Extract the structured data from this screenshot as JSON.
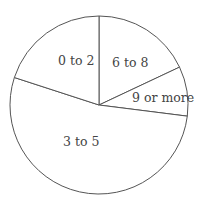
{
  "chart_data": {
    "type": "pie",
    "title": "",
    "categories": [
      "0 to 2",
      "3 to 5",
      "6 to 8",
      "9 or more"
    ],
    "values": [
      20,
      53,
      18,
      9
    ],
    "unit": "percent (estimated from slice angles)",
    "legend": "none (labels inside slices)",
    "start_angle_deg": 90,
    "direction": "clockwise starting with 6 to 8 at top",
    "colors": {
      "fill": "#ffffff",
      "stroke": "#555555",
      "text": "#444444"
    }
  },
  "labels": {
    "l0": "0 to 2",
    "l1": "3 to 5",
    "l2": "6 to 8",
    "l3": "9 or more"
  }
}
